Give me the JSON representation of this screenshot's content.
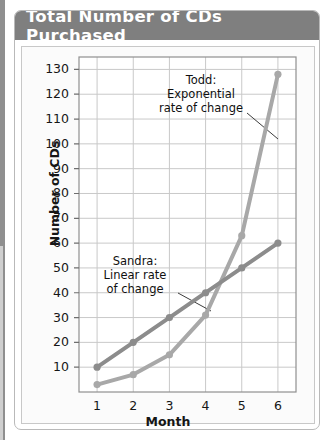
{
  "card": {
    "title": "Total Number of CDs Purchased",
    "title_bar_color": "#7f7f7f",
    "title_text_color": "#ffffff"
  },
  "chart_data": {
    "type": "line",
    "title": "Total Number of CDs Purchased",
    "xlabel": "Month",
    "ylabel": "Number of CDs",
    "x": [
      1,
      2,
      3,
      4,
      5,
      6
    ],
    "xticklabels": [
      "1",
      "2",
      "3",
      "4",
      "5",
      "6"
    ],
    "xlim": [
      0.5,
      6.5
    ],
    "ylim": [
      0,
      135
    ],
    "yticks": [
      10,
      20,
      30,
      40,
      50,
      60,
      70,
      80,
      90,
      100,
      110,
      120,
      130
    ],
    "yticklabels": [
      "10",
      "20",
      "30",
      "40",
      "50",
      "60",
      "70",
      "80",
      "90",
      "100",
      "110",
      "120",
      "130"
    ],
    "grid": true,
    "legend": "none (annotated in-plot)",
    "series": [
      {
        "name": "Sandra",
        "description": "Linear rate of change",
        "color": "#8c8c8c",
        "values": [
          10,
          20,
          30,
          40,
          50,
          60
        ]
      },
      {
        "name": "Todd",
        "description": "Exponential rate of change",
        "color": "#a8a8a8",
        "values": [
          3,
          7,
          15,
          31,
          63,
          128
        ]
      }
    ],
    "annotations": [
      {
        "id": "todd-label",
        "lines": [
          "Todd:",
          "Exponential",
          "rate of change"
        ],
        "points_to_series": "Todd"
      },
      {
        "id": "sandra-label",
        "lines": [
          "Sandra:",
          "Linear rate",
          "of change"
        ],
        "points_to_series": "Sandra"
      }
    ]
  }
}
